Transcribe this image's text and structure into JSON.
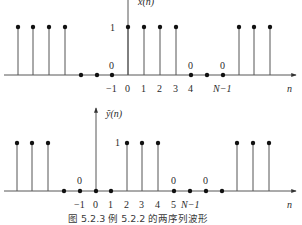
{
  "figure": {
    "caption": "图 5.2.3   例 5.2.2 的两序列波形"
  },
  "chart_data": [
    {
      "type": "stem",
      "title": "x(n)",
      "ylabel": "x(n)",
      "xlabel": "n",
      "amplitude_label": "1",
      "tick_labels": [
        "−1",
        "0",
        "1",
        "2",
        "3",
        "4",
        "N−1"
      ],
      "zero_labels": [
        "0",
        "0",
        "0"
      ],
      "points": [
        {
          "x": 18,
          "v": 1
        },
        {
          "x": 33,
          "v": 1
        },
        {
          "x": 49,
          "v": 1
        },
        {
          "x": 65,
          "v": 1
        },
        {
          "x": 81,
          "v": 0
        },
        {
          "x": 97,
          "v": 0
        },
        {
          "x": 112,
          "v": 0,
          "n": "-1"
        },
        {
          "x": 128,
          "v": 1,
          "n": "0"
        },
        {
          "x": 144,
          "v": 1,
          "n": "1"
        },
        {
          "x": 160,
          "v": 1,
          "n": "2"
        },
        {
          "x": 176,
          "v": 1,
          "n": "3"
        },
        {
          "x": 191,
          "v": 0,
          "n": "4"
        },
        {
          "x": 207,
          "v": 0
        },
        {
          "x": 223,
          "v": 0,
          "n": "N-1"
        },
        {
          "x": 239,
          "v": 1
        },
        {
          "x": 254,
          "v": 1
        },
        {
          "x": 270,
          "v": 1
        }
      ],
      "description": "Periodic sequence: 1 for n = 0..3, 0 for n = 4..N-1, repeated"
    },
    {
      "type": "stem",
      "title": "ỹ(n)",
      "ylabel": "ỹ(n)",
      "xlabel": "n",
      "amplitude_label": "1",
      "tick_labels": [
        "−1",
        "0",
        "1",
        "2",
        "3",
        "4",
        "5",
        "N−1"
      ],
      "zero_labels": [
        "0",
        "0",
        "0"
      ],
      "points": [
        {
          "x": 17,
          "v": 1
        },
        {
          "x": 32,
          "v": 1
        },
        {
          "x": 48,
          "v": 1
        },
        {
          "x": 64,
          "v": 0
        },
        {
          "x": 80,
          "v": 0,
          "n": "-1"
        },
        {
          "x": 96,
          "v": 0,
          "n": "0"
        },
        {
          "x": 111,
          "v": 0,
          "n": "1"
        },
        {
          "x": 127,
          "v": 1,
          "n": "2"
        },
        {
          "x": 142,
          "v": 1,
          "n": "3"
        },
        {
          "x": 158,
          "v": 1,
          "n": "4"
        },
        {
          "x": 174,
          "v": 0,
          "n": "5"
        },
        {
          "x": 190,
          "v": 0,
          "n": "N-1"
        },
        {
          "x": 206,
          "v": 0
        },
        {
          "x": 222,
          "v": 0
        },
        {
          "x": 237,
          "v": 1
        },
        {
          "x": 253,
          "v": 1
        },
        {
          "x": 269,
          "v": 1
        }
      ],
      "description": "Periodic sequence: 1 for n = 2..4, 0 otherwise within the period, repeated"
    }
  ],
  "plots": {
    "top": {
      "ylabel": "x(n)",
      "xlabel": "n",
      "one": "1",
      "ticks": {
        "m1": "−1",
        "t0": "0",
        "t1": "1",
        "t2": "2",
        "t3": "3",
        "t4": "4",
        "tN": "N−1"
      },
      "zeros": {
        "z1": "0",
        "z2": "0",
        "z3": "0"
      }
    },
    "bottom": {
      "ylabel": "ỹ(n)",
      "xlabel": "n",
      "one": "1",
      "ticks": {
        "m1": "−1",
        "t0": "0",
        "t1": "1",
        "t2": "2",
        "t3": "3",
        "t4": "4",
        "t5": "5",
        "tN": "N−1"
      },
      "zeros": {
        "z1": "0",
        "z2": "0",
        "z3": "0"
      }
    }
  }
}
